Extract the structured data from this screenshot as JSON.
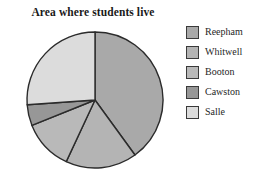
{
  "chart_data": {
    "type": "pie",
    "title": "Area where students live",
    "xlabel": "",
    "ylabel": "",
    "legend_position": "right",
    "grid": false,
    "start_angle_deg": 0,
    "direction": "clockwise",
    "categories": [
      "Reepham",
      "Whitwell",
      "Booton",
      "Cawston",
      "Salle"
    ],
    "values": [
      40,
      17,
      12,
      5,
      26
    ],
    "units": "percent",
    "slices": [
      {
        "label": "Reepham",
        "value": 40,
        "color": "#a9a9a9",
        "start_deg": 0,
        "end_deg": 144
      },
      {
        "label": "Whitwell",
        "value": 17,
        "color": "#b4b4b4",
        "start_deg": 144,
        "end_deg": 205
      },
      {
        "label": "Booton",
        "value": 12,
        "color": "#b9b9b9",
        "start_deg": 205,
        "end_deg": 248
      },
      {
        "label": "Cawston",
        "value": 5,
        "color": "#979797",
        "start_deg": 248,
        "end_deg": 266
      },
      {
        "label": "Salle",
        "value": 26,
        "color": "#dcdcdc",
        "start_deg": 266,
        "end_deg": 360
      }
    ]
  },
  "legend": {
    "items": [
      {
        "label": "Reepham",
        "color": "#a9a9a9"
      },
      {
        "label": "Whitwell",
        "color": "#b4b4b4"
      },
      {
        "label": "Booton",
        "color": "#b9b9b9"
      },
      {
        "label": "Cawston",
        "color": "#979797"
      },
      {
        "label": "Salle",
        "color": "#dcdcdc"
      }
    ]
  },
  "style": {
    "outline_color": "#2b2b2b",
    "background": "#ffffff"
  }
}
